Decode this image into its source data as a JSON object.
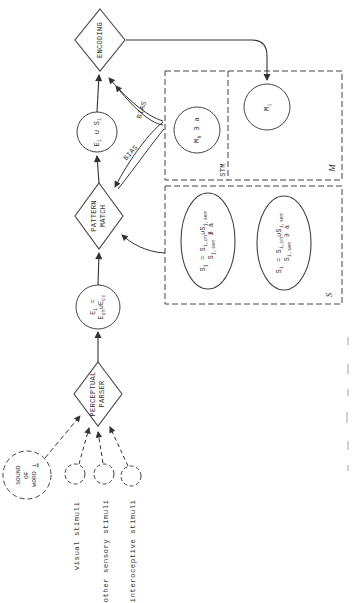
{
  "nodes": {
    "encoding": "ENCODING",
    "pattern_match": [
      "PATTERN",
      "MATCH"
    ],
    "perceptual_parser": [
      "PERCEPTUAL",
      "PARSER"
    ],
    "sound_of_word": {
      "line1": "SOUND",
      "line2": "OF",
      "line3": [
        {
          "t": "WORD "
        },
        {
          "t": "i",
          "u": true
        }
      ]
    },
    "e_union_s": [
      {
        "t": "E"
      },
      {
        "t": "i",
        "sub": true
      },
      {
        "t": " ∪ "
      },
      {
        "t": "S"
      },
      {
        "t": "i",
        "sub": true
      }
    ],
    "e_def": {
      "line1": [
        {
          "t": "E"
        },
        {
          "t": "i",
          "sub": true
        },
        {
          "t": " ="
        }
      ],
      "line2": [
        {
          "t": "E"
        },
        {
          "t": "ph",
          "sub": true
        },
        {
          "t": "∪"
        },
        {
          "t": "E"
        },
        {
          "t": "cx",
          "sub": true
        }
      ]
    },
    "m_h": [
      {
        "t": "M"
      },
      {
        "t": "h",
        "sub": true
      },
      {
        "t": " ∋ a"
      }
    ],
    "m_i": [
      {
        "t": "M"
      },
      {
        "t": "i",
        "sub": true
      }
    ]
  },
  "memory_boxes": {
    "stm_label": "STM",
    "m_label": "M",
    "s_label": "S"
  },
  "ltm_sets": {
    "s_j": {
      "line1": [
        {
          "t": "S"
        },
        {
          "t": "j",
          "sub": true
        },
        {
          "t": " = "
        },
        {
          "t": "S"
        },
        {
          "t": "i,ph",
          "sub": true
        },
        {
          "t": "∪"
        },
        {
          "t": "S"
        },
        {
          "t": "j,sem",
          "sub": true
        }
      ],
      "line2": [
        {
          "t": "S"
        },
        {
          "t": "j,sem",
          "sub": true
        },
        {
          "t": " ∌ a"
        }
      ]
    },
    "s_i": {
      "line1": [
        {
          "t": "S"
        },
        {
          "t": "i",
          "sub": true
        },
        {
          "t": " = "
        },
        {
          "t": "S"
        },
        {
          "t": "i,ph",
          "sub": true
        },
        {
          "t": "∪"
        },
        {
          "t": "S"
        },
        {
          "t": "i,sem",
          "sub": true
        }
      ],
      "line2": [
        {
          "t": "S"
        },
        {
          "t": "i,sem",
          "sub": true
        },
        {
          "t": " ∋ a"
        }
      ]
    }
  },
  "edge_labels": {
    "bias_to_encoding": "BIAS",
    "bias_to_pattern_match": "BIAS"
  },
  "stimuli_labels": {
    "visual": "visual stimuli",
    "other": "other sensory stimuli",
    "interoceptive": "interoceptive stimuli"
  },
  "colors": {
    "ink": "#333333",
    "line": "#444444",
    "background": "#ffffff"
  }
}
